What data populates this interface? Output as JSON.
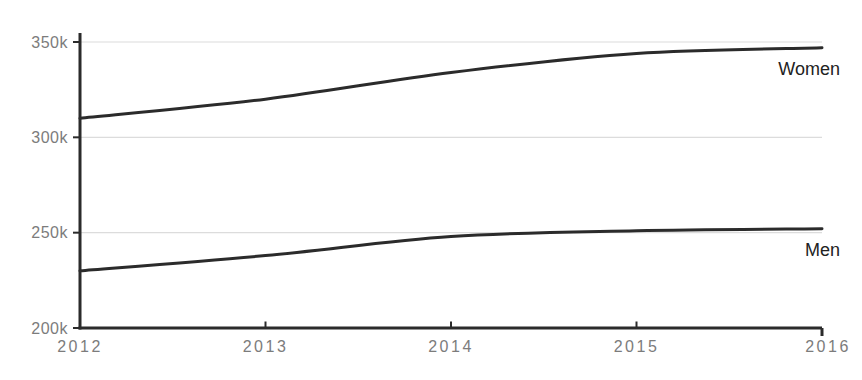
{
  "chart_data": {
    "type": "line",
    "title": "",
    "xlabel": "",
    "ylabel": "",
    "x": [
      2012,
      2013,
      2014,
      2015,
      2016
    ],
    "x_tick_labels": [
      "2012",
      "2013",
      "2014",
      "2015",
      "2016"
    ],
    "y_ticks": [
      350000,
      300000,
      250000,
      200000
    ],
    "y_tick_labels": [
      "350k",
      "300k",
      "250k",
      "200k"
    ],
    "ylim": [
      200000,
      350000
    ],
    "grid": true,
    "legend_position": "end-of-line",
    "series": [
      {
        "name": "Women",
        "values": [
          310000,
          320000,
          334000,
          344000,
          347000
        ]
      },
      {
        "name": "Men",
        "values": [
          230000,
          238000,
          248000,
          251000,
          252000
        ]
      }
    ],
    "colors": {
      "line": "#2b2b2b",
      "axis": "#2b2b2b",
      "grid": "#dcdcdc",
      "tick_label": "#7c7c7c",
      "series_label": "#222222",
      "background": "#ffffff"
    }
  }
}
